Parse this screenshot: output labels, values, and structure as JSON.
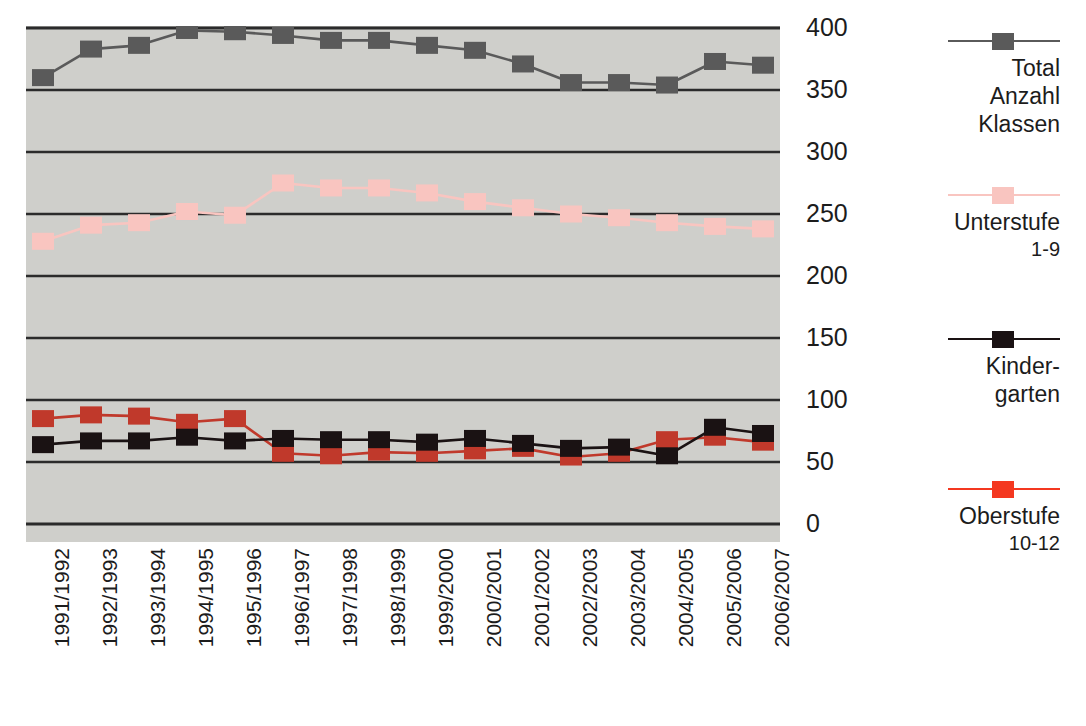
{
  "chart_data": {
    "type": "line",
    "title": "",
    "xlabel": "",
    "ylabel": "",
    "ylim": [
      0,
      400
    ],
    "yticks": [
      0,
      50,
      100,
      150,
      200,
      250,
      300,
      350,
      400
    ],
    "ytick_labels": [
      "0",
      "50",
      "100",
      "150",
      "200",
      "250",
      "300",
      "350",
      "400"
    ],
    "grid": true,
    "legend_position": "right",
    "categories": [
      "1991/1992",
      "1992/1993",
      "1993/1994",
      "1994/1995",
      "1995/1996",
      "1996/1997",
      "1997/1998",
      "1998/1999",
      "1999/2000",
      "2000/2001",
      "2001/2002",
      "2002/2003",
      "2003/2004",
      "2004/2005",
      "2005/2006",
      "2006/2007"
    ],
    "series": [
      {
        "name": "Total Anzahl Klassen",
        "color": "#5a5a5a",
        "values": [
          360,
          383,
          386,
          398,
          397,
          394,
          390,
          390,
          386,
          382,
          371,
          356,
          356,
          354,
          373,
          370
        ]
      },
      {
        "name": "Unterstufe 1-9",
        "color": "#f9c5c0",
        "values": [
          228,
          241,
          243,
          252,
          249,
          275,
          271,
          271,
          267,
          260,
          255,
          250,
          247,
          243,
          240,
          238
        ]
      },
      {
        "name": "Kindergarten",
        "color": "#1a1213",
        "values": [
          64,
          67,
          67,
          70,
          67,
          69,
          68,
          68,
          66,
          69,
          65,
          61,
          62,
          55,
          78,
          73
        ]
      },
      {
        "name": "Oberstufe 10-12",
        "color": "#c0392b",
        "values": [
          85,
          88,
          87,
          82,
          85,
          57,
          55,
          58,
          57,
          59,
          61,
          54,
          57,
          68,
          70,
          66
        ]
      }
    ]
  },
  "legend": {
    "entries": [
      {
        "key": "total",
        "marker_color": "#5a5a5a",
        "line_color": "#5a5a5a",
        "label": "Total",
        "label2": "Anzahl",
        "label3": "Klassen",
        "sub": ""
      },
      {
        "key": "unterstufe",
        "marker_color": "#f9c5c0",
        "line_color": "#f9c5c0",
        "label": "Unterstufe",
        "label2": "",
        "label3": "",
        "sub": "1-9"
      },
      {
        "key": "kindergarten",
        "marker_color": "#1a1213",
        "line_color": "#1a1213",
        "label": "Kinder-",
        "label2": "garten",
        "label3": "",
        "sub": ""
      },
      {
        "key": "oberstufe",
        "marker_color": "#f43820",
        "line_color": "#f43820",
        "label": "Oberstufe",
        "label2": "",
        "label3": "",
        "sub": "10-12"
      }
    ]
  },
  "colors": {
    "plot_background": "#cfcfcb",
    "gridline": "#2b2b2b",
    "page_background": "#ffffff",
    "text": "#1c1c1c"
  }
}
